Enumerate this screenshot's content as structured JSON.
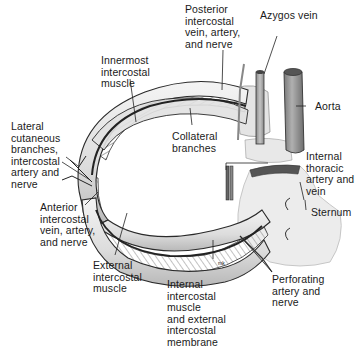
{
  "labels": {
    "innermost_intercostal": "Innermost\nintercostal\nmuscle",
    "posterior_intercostal": "Posterior\nintercostal\nvein, artery,\nand nerve",
    "azygos_vein": "Azygos vein",
    "aorta": "Aorta",
    "lateral_cutaneous": "Lateral\ncutaneous\nbranches,\nintercostal\nartery and\nnerve",
    "collateral_branches": "Collateral\nbranches",
    "internal_thoracic": "Internal\nthoracic\nartery and\nvein",
    "sternum": "Sternum",
    "anterior_intercostal": "Anterior\nintercostal\nvein, artery,\nand nerve",
    "external_intercostal": "External\nintercostal\nmuscle",
    "internal_intercostal": "Internal\nintercostal\nmuscle\nand external\nintercostal\nmembrane",
    "perforating": "Perforating\nartery and\nnerve",
    "signature": "mk"
  },
  "colors": {
    "outline": "#2a2a2a",
    "rib_fill": "#e6e6e6",
    "rib_shade": "#c4c4c4",
    "muscle": "#8a8a8a",
    "aorta": "#9a9a9a",
    "sternum": "#ededed"
  }
}
